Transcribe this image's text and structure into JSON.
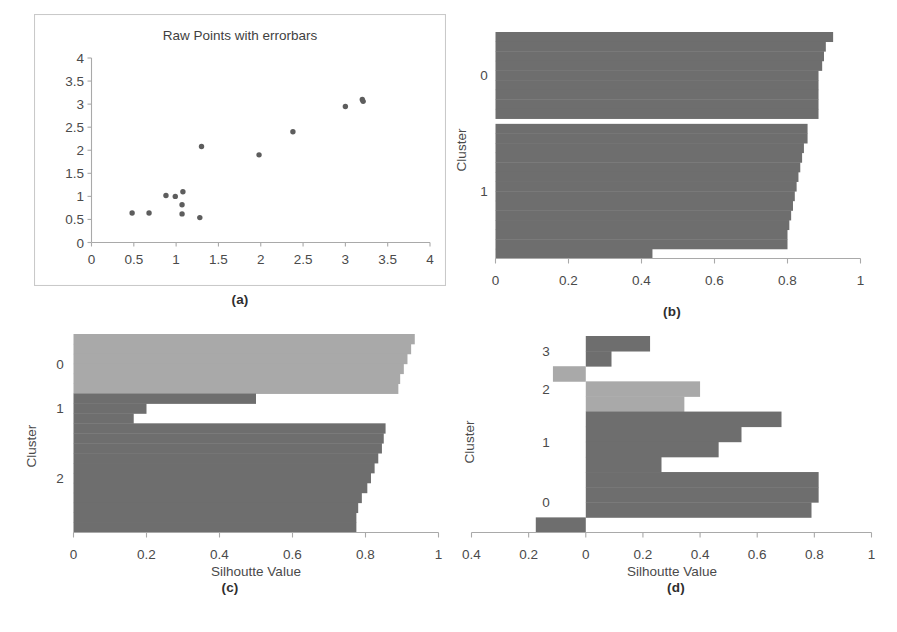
{
  "figure": {
    "panels": [
      {
        "id": "a",
        "caption": "(a)",
        "label": "a"
      },
      {
        "id": "b",
        "caption": "(b)",
        "label": "b"
      },
      {
        "id": "c",
        "caption": "(c)",
        "label": "c"
      },
      {
        "id": "d",
        "caption": "(d)",
        "label": "d"
      }
    ],
    "colors": {
      "dark_gray": "#6e6e6e",
      "light_gray": "#a9a9a9",
      "axis": "#a9a9a9",
      "text": "#4a4a4a",
      "frame": "#c9c9c9",
      "background": "#ffffff",
      "point": "#5d5d5d"
    },
    "common": {
      "xlabel": "Silhoutte Value",
      "ylabel": "Cluster"
    }
  },
  "chart_data": [
    {
      "id": "panel-a",
      "type": "scatter",
      "title": "Raw Points with errorbars",
      "xlabel": "",
      "ylabel": "",
      "xlim": [
        0,
        4
      ],
      "ylim": [
        0,
        4
      ],
      "xticks": [
        0,
        0.5,
        1,
        1.5,
        2,
        2.5,
        3,
        3.5,
        4
      ],
      "xticklabels": [
        "0",
        "0.5",
        "1",
        "1.5",
        "2",
        "2.5",
        "3",
        "3.5",
        "4"
      ],
      "yticks": [
        0,
        0.5,
        1,
        1.5,
        2,
        2.5,
        3,
        3.5,
        4
      ],
      "yticklabels": [
        "0",
        "0.5",
        "1",
        "1.5",
        "2",
        "2.5",
        "3",
        "3.5",
        "4"
      ],
      "grid": false,
      "legend": null,
      "points": [
        {
          "x": 0.48,
          "y": 0.64
        },
        {
          "x": 0.68,
          "y": 0.64
        },
        {
          "x": 0.88,
          "y": 1.02
        },
        {
          "x": 0.99,
          "y": 1.0
        },
        {
          "x": 1.08,
          "y": 1.1
        },
        {
          "x": 1.07,
          "y": 0.82
        },
        {
          "x": 1.07,
          "y": 0.62
        },
        {
          "x": 1.28,
          "y": 0.54
        },
        {
          "x": 1.3,
          "y": 2.08
        },
        {
          "x": 1.98,
          "y": 1.9
        },
        {
          "x": 2.38,
          "y": 2.4
        },
        {
          "x": 3.0,
          "y": 2.95
        },
        {
          "x": 3.2,
          "y": 3.1
        },
        {
          "x": 3.21,
          "y": 3.06
        }
      ]
    },
    {
      "id": "panel-b",
      "type": "bar",
      "orientation": "horizontal",
      "title": "",
      "xlabel": "Silhoutte Value",
      "ylabel": "Cluster",
      "xlim": [
        0,
        1
      ],
      "xticks": [
        0,
        0.2,
        0.4,
        0.6,
        0.8,
        1
      ],
      "xticklabels": [
        "0",
        "0.2",
        "0.4",
        "0.6",
        "0.8",
        "1"
      ],
      "grid": false,
      "legend": null,
      "clusters": [
        {
          "label": "0",
          "color": "#6e6e6e",
          "values": [
            0.925,
            0.905,
            0.9,
            0.895,
            0.885,
            0.885,
            0.885,
            0.885,
            0.885
          ]
        },
        {
          "label": "1",
          "color": "#6e6e6e",
          "values": [
            0.855,
            0.855,
            0.845,
            0.84,
            0.835,
            0.83,
            0.825,
            0.82,
            0.815,
            0.81,
            0.805,
            0.8,
            0.8,
            0.43
          ]
        }
      ]
    },
    {
      "id": "panel-c",
      "type": "bar",
      "orientation": "horizontal",
      "title": "",
      "xlabel": "Silhoutte Value",
      "ylabel": "Cluster",
      "xlim": [
        0,
        1
      ],
      "xticks": [
        0,
        0.2,
        0.4,
        0.6,
        0.8,
        1
      ],
      "xticklabels": [
        "0",
        "0.2",
        "0.4",
        "0.6",
        "0.8",
        "1"
      ],
      "grid": false,
      "legend": null,
      "clusters": [
        {
          "label": "0",
          "color": "#a9a9a9",
          "values": [
            0.935,
            0.925,
            0.915,
            0.905,
            0.895,
            0.89
          ]
        },
        {
          "label": "1",
          "color": "#6e6e6e",
          "values": [
            0.5,
            0.2,
            0.165
          ]
        },
        {
          "label": "2",
          "color": "#6e6e6e",
          "values": [
            0.855,
            0.85,
            0.845,
            0.835,
            0.825,
            0.815,
            0.805,
            0.79,
            0.78,
            0.775,
            0.775
          ]
        }
      ]
    },
    {
      "id": "panel-d",
      "type": "bar",
      "orientation": "horizontal",
      "title": "",
      "xlabel": "Silhoutte Value",
      "ylabel": "Cluster",
      "xlim": [
        -0.4,
        1
      ],
      "xticks": [
        -0.4,
        -0.2,
        0,
        0.2,
        0.4,
        0.6,
        0.8,
        1
      ],
      "xticklabels": [
        "0.4",
        "0.2",
        "0",
        "0.2",
        "0.4",
        "0.6",
        "0.8",
        "1"
      ],
      "grid": false,
      "legend": null,
      "clusters": [
        {
          "label": "3",
          "color": "#6e6e6e",
          "values": [
            0.225,
            0.09
          ]
        },
        {
          "label": "2",
          "color": "#a9a9a9",
          "values": [
            -0.115,
            0.4,
            0.345
          ]
        },
        {
          "label": "1",
          "color": "#6e6e6e",
          "values": [
            0.685,
            0.545,
            0.465,
            0.265
          ]
        },
        {
          "label": "0",
          "color": "#6e6e6e",
          "values": [
            0.815,
            0.815,
            0.79,
            -0.175
          ]
        }
      ]
    }
  ]
}
